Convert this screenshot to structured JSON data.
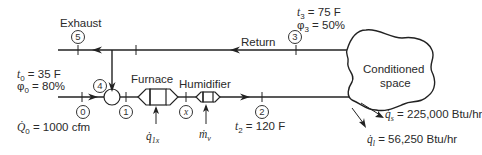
{
  "labels": {
    "exhaust": "Exhaust",
    "return": "Return",
    "furnace": "Furnace",
    "humidifier": "Humidifier",
    "conditioned_space_line1": "Conditioned",
    "conditioned_space_line2": "space"
  },
  "nodes": {
    "n0": "0",
    "n1": "1",
    "n2": "2",
    "n3": "3",
    "n4": "4",
    "n5": "5",
    "nx": "x"
  },
  "state0": {
    "t_symbol": "t",
    "t_sub": "0",
    "t_value": " = 35 F",
    "phi_symbol": "φ",
    "phi_sub": "0",
    "phi_value": " = 80%",
    "Q_symbol": "Q̇",
    "Q_sub": "0",
    "Q_value": " = 1000 cfm"
  },
  "state2": {
    "t_symbol": "t",
    "t_sub": "2",
    "t_value": " = 120 F"
  },
  "state3": {
    "t_symbol": "t",
    "t_sub": "3",
    "t_value": " = 75 F",
    "phi_symbol": "φ",
    "phi_sub": "3",
    "phi_value": " = 50%"
  },
  "inputs": {
    "furnace_heat_symbol": "q̇",
    "furnace_heat_sub": "1x",
    "humidifier_water_symbol": "ṁ",
    "humidifier_water_sub": "v"
  },
  "loads": {
    "sensible_symbol": "q̇",
    "sensible_sub": "s",
    "sensible_value": " = 225,000 Btu/hr",
    "latent_symbol": "q̇",
    "latent_sub": "l",
    "latent_value": " = 56,250 Btu/hr"
  }
}
